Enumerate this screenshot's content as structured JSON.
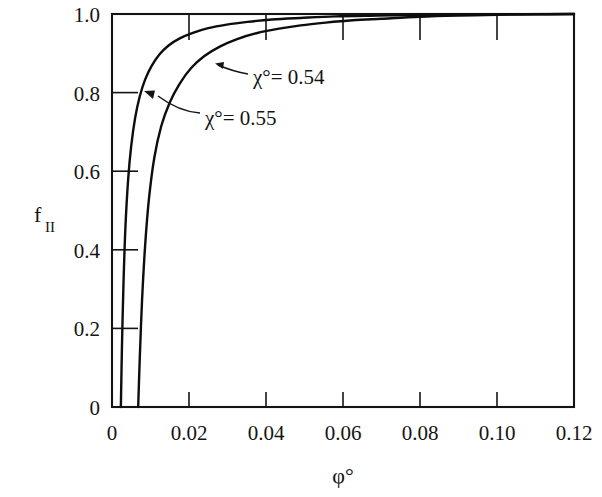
{
  "figure": {
    "background_color": "#ffffff",
    "ink_color": "#141414"
  },
  "chart_data": {
    "type": "line",
    "title": "",
    "subtitle": "",
    "xlabel": "φ°",
    "ylabel": "f",
    "ylabel_subscript": "II",
    "xlim": [
      0,
      0.12
    ],
    "ylim": [
      0,
      1.0
    ],
    "xticks": [
      0,
      0.02,
      0.04,
      0.06,
      0.08,
      0.1,
      0.12
    ],
    "xticklabels": [
      "0",
      "0.02",
      "0.04",
      "0.06",
      "0.08",
      "0.10",
      "0.12"
    ],
    "yticks": [
      0,
      0.2,
      0.4,
      0.6,
      0.8,
      1.0
    ],
    "yticklabels": [
      "0",
      "0.2",
      "0.4",
      "0.6",
      "0.8",
      "1.0"
    ],
    "grid": false,
    "legend_position": "inline-annotations",
    "series": [
      {
        "name": "χ° = 0.54",
        "label_text": "χ°= 0.54",
        "chi_value": 0.54,
        "color": "#0d0d0d",
        "x": [
          0.0068,
          0.0072,
          0.0078,
          0.0086,
          0.0096,
          0.011,
          0.0128,
          0.015,
          0.0176,
          0.0205,
          0.024,
          0.028,
          0.0325,
          0.0375,
          0.043,
          0.049,
          0.0555,
          0.0625,
          0.07,
          0.08,
          0.09,
          0.1,
          0.11,
          0.12
        ],
        "y": [
          0.0,
          0.12,
          0.27,
          0.41,
          0.53,
          0.635,
          0.715,
          0.775,
          0.823,
          0.862,
          0.893,
          0.917,
          0.936,
          0.951,
          0.962,
          0.971,
          0.978,
          0.984,
          0.988,
          0.993,
          0.996,
          0.998,
          0.999,
          1.0
        ]
      },
      {
        "name": "χ° = 0.55",
        "label_text": "χ°= 0.55",
        "chi_value": 0.55,
        "color": "#0d0d0d",
        "x": [
          0.0023,
          0.0026,
          0.003,
          0.0035,
          0.0042,
          0.005,
          0.006,
          0.0072,
          0.0086,
          0.0103,
          0.0123,
          0.0147,
          0.0176,
          0.021,
          0.025,
          0.0298,
          0.0352,
          0.0415,
          0.049,
          0.058,
          0.069,
          0.082,
          0.098,
          0.12
        ],
        "y": [
          0.0,
          0.16,
          0.32,
          0.46,
          0.58,
          0.665,
          0.735,
          0.79,
          0.833,
          0.868,
          0.897,
          0.92,
          0.938,
          0.952,
          0.964,
          0.973,
          0.98,
          0.986,
          0.99,
          0.994,
          0.996,
          0.998,
          0.999,
          1.0
        ]
      }
    ],
    "annotations": [
      {
        "id": "annot-chi-054",
        "text": "χ°= 0.54",
        "target_series": "χ° = 0.54",
        "text_x_px": 253,
        "text_y_px": 77,
        "arrow_tip_x_px": 215,
        "arrow_tip_y_px": 64
      },
      {
        "id": "annot-chi-055",
        "text": "χ°= 0.55",
        "target_series": "χ° = 0.55",
        "text_x_px": 205,
        "text_y_px": 118,
        "arrow_tip_x_px": 144,
        "arrow_tip_y_px": 92
      }
    ]
  },
  "axes_geometry": {
    "left_px": 112,
    "right_px": 574,
    "top_px": 14,
    "bottom_px": 407
  }
}
